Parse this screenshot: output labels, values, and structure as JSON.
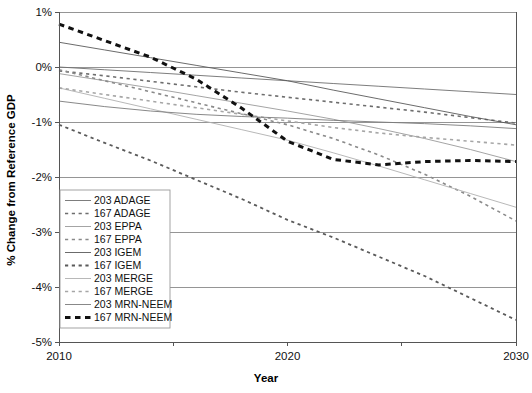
{
  "chart_data": {
    "type": "line",
    "title": "",
    "xlabel": "Year",
    "ylabel": "% Change from Reference GDP",
    "xlim": [
      2010,
      2030
    ],
    "ylim": [
      -5,
      1
    ],
    "xticks": [
      2010,
      2015,
      2020,
      2025,
      2030
    ],
    "xticklabels": [
      "2010",
      "",
      "2020",
      "",
      "2030"
    ],
    "yticks": [
      1,
      0,
      -1,
      -2,
      -3,
      -4,
      -5
    ],
    "yticklabels": [
      "1%",
      "0%",
      "-1%",
      "-2%",
      "-3%",
      "-4%",
      "-5%"
    ],
    "grid": true,
    "grid_axis": "y",
    "legend_position": "lower-left-inside",
    "x": [
      2010,
      2012,
      2014,
      2016,
      2018,
      2020,
      2022,
      2024,
      2026,
      2028,
      2030
    ],
    "series": [
      {
        "name": "203 ADAGE",
        "style": "solid",
        "color": "#6e6e6e",
        "width": 0.9,
        "values": [
          0.0,
          -0.05,
          -0.1,
          -0.15,
          -0.2,
          -0.25,
          -0.3,
          -0.35,
          -0.4,
          -0.45,
          -0.5
        ]
      },
      {
        "name": "167 ADAGE",
        "style": "dashed",
        "color": "#6e6e6e",
        "width": 1.6,
        "values": [
          -0.07,
          -0.16,
          -0.26,
          -0.36,
          -0.46,
          -0.55,
          -0.64,
          -0.73,
          -0.82,
          -0.92,
          -1.02
        ]
      },
      {
        "name": "203 EPPA",
        "style": "solid",
        "color": "#9a9a9a",
        "width": 0.9,
        "values": [
          -0.12,
          -0.25,
          -0.38,
          -0.52,
          -0.66,
          -0.8,
          -0.95,
          -1.12,
          -1.3,
          -1.5,
          -1.72
        ]
      },
      {
        "name": "167 EPPA",
        "style": "dashed",
        "color": "#8a8a8a",
        "width": 1.6,
        "values": [
          -0.05,
          -0.25,
          -0.45,
          -0.65,
          -0.85,
          -1.05,
          -1.3,
          -1.6,
          -1.95,
          -2.35,
          -2.8
        ]
      },
      {
        "name": "203 IGEM",
        "style": "solid",
        "color": "#5a5a5a",
        "width": 0.9,
        "values": [
          0.45,
          0.31,
          0.17,
          0.03,
          -0.11,
          -0.25,
          -0.42,
          -0.58,
          -0.74,
          -0.9,
          -1.05
        ]
      },
      {
        "name": "167 IGEM",
        "style": "dashed",
        "color": "#5a5a5a",
        "width": 1.8,
        "values": [
          -1.05,
          -1.38,
          -1.7,
          -2.05,
          -2.4,
          -2.78,
          -3.1,
          -3.45,
          -3.8,
          -4.2,
          -4.6
        ]
      },
      {
        "name": "203 MERGE",
        "style": "solid",
        "color": "#b0b0b0",
        "width": 0.9,
        "values": [
          -0.38,
          -0.57,
          -0.76,
          -0.95,
          -1.14,
          -1.33,
          -1.56,
          -1.8,
          -2.05,
          -2.3,
          -2.55
        ]
      },
      {
        "name": "167 MERGE",
        "style": "dashed",
        "color": "#a6a6a6",
        "width": 1.6,
        "values": [
          -0.38,
          -0.5,
          -0.62,
          -0.74,
          -0.86,
          -0.98,
          -1.1,
          -1.2,
          -1.28,
          -1.35,
          -1.42
        ]
      },
      {
        "name": "203 MRN-NEEM",
        "style": "solid",
        "color": "#7a7a7a",
        "width": 0.9,
        "values": [
          -0.62,
          -0.72,
          -0.8,
          -0.86,
          -0.9,
          -0.93,
          -0.97,
          -1.0,
          -1.03,
          -1.07,
          -1.12
        ]
      },
      {
        "name": "167 MRN-NEEM",
        "style": "dashed-bold",
        "color": "#111111",
        "width": 3.0,
        "values": [
          0.78,
          0.48,
          0.18,
          -0.22,
          -0.75,
          -1.35,
          -1.68,
          -1.78,
          -1.72,
          -1.7,
          -1.72
        ]
      }
    ]
  },
  "legend": {
    "items": [
      {
        "label": "203 ADAGE"
      },
      {
        "label": "167 ADAGE"
      },
      {
        "label": "203 EPPA"
      },
      {
        "label": "167 EPPA"
      },
      {
        "label": "203 IGEM"
      },
      {
        "label": "167 IGEM"
      },
      {
        "label": "203 MERGE"
      },
      {
        "label": "167 MERGE"
      },
      {
        "label": "203 MRN-NEEM"
      },
      {
        "label": "167 MRN-NEEM"
      }
    ]
  },
  "axes": {
    "y_title": "% Change from Reference GDP",
    "x_title": "Year",
    "y_labels": [
      "1%",
      "0%",
      "-1%",
      "-2%",
      "-3%",
      "-4%",
      "-5%"
    ],
    "x_labels": [
      "2010",
      "2020",
      "2030"
    ]
  }
}
